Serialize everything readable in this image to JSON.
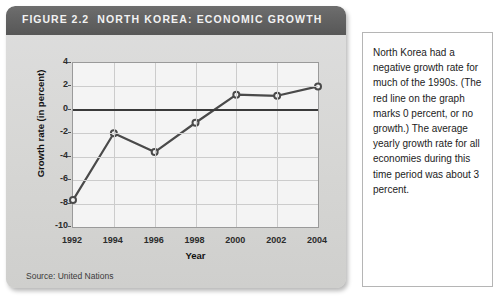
{
  "figure": {
    "number": "FIGURE 2.2",
    "title": "NORTH KOREA: ECONOMIC GROWTH",
    "source": "Source: United Nations"
  },
  "side_panel": {
    "body": "North Korea had a negative growth rate for much of the 1990s. (The red line on the graph marks 0 percent, or no growth.) The average yearly growth rate for all economies during this time period was about 3 percent."
  },
  "colors": {
    "header_bar": "#636363",
    "card_background": "#d6d6d4",
    "plot_background": "#f4f4f4",
    "series_line": "#4a4a4a",
    "zero_line": "#3a3a3a",
    "gridline": "#cccccc",
    "panel_background": "#ffffff"
  },
  "chart_data": {
    "type": "line",
    "title": "NORTH KOREA: ECONOMIC GROWTH",
    "xlabel": "Year",
    "ylabel": "Growth rate (in percent)",
    "x": [
      1992,
      1994,
      1996,
      1998,
      2000,
      2002,
      2004
    ],
    "xtick_labels": [
      "1992",
      "1994",
      "1996",
      "1998",
      "2000",
      "2002",
      "2004"
    ],
    "values": [
      -7.7,
      -2.0,
      -3.6,
      -1.1,
      1.3,
      1.2,
      2.0
    ],
    "ylim": [
      -10,
      4
    ],
    "ytick_labels": [
      "4",
      "2",
      "0",
      "-2",
      "-4",
      "-6",
      "-8",
      "-10"
    ],
    "ytick_values": [
      4,
      2,
      0,
      -2,
      -4,
      -6,
      -8,
      -10
    ],
    "grid": true,
    "legend": "none",
    "annotations": [
      {
        "label": "zero-reference-line",
        "y": 0
      }
    ],
    "series": [
      {
        "name": "North Korea growth rate",
        "values": [
          -7.7,
          -2.0,
          -3.6,
          -1.1,
          1.3,
          1.2,
          2.0
        ]
      }
    ]
  }
}
